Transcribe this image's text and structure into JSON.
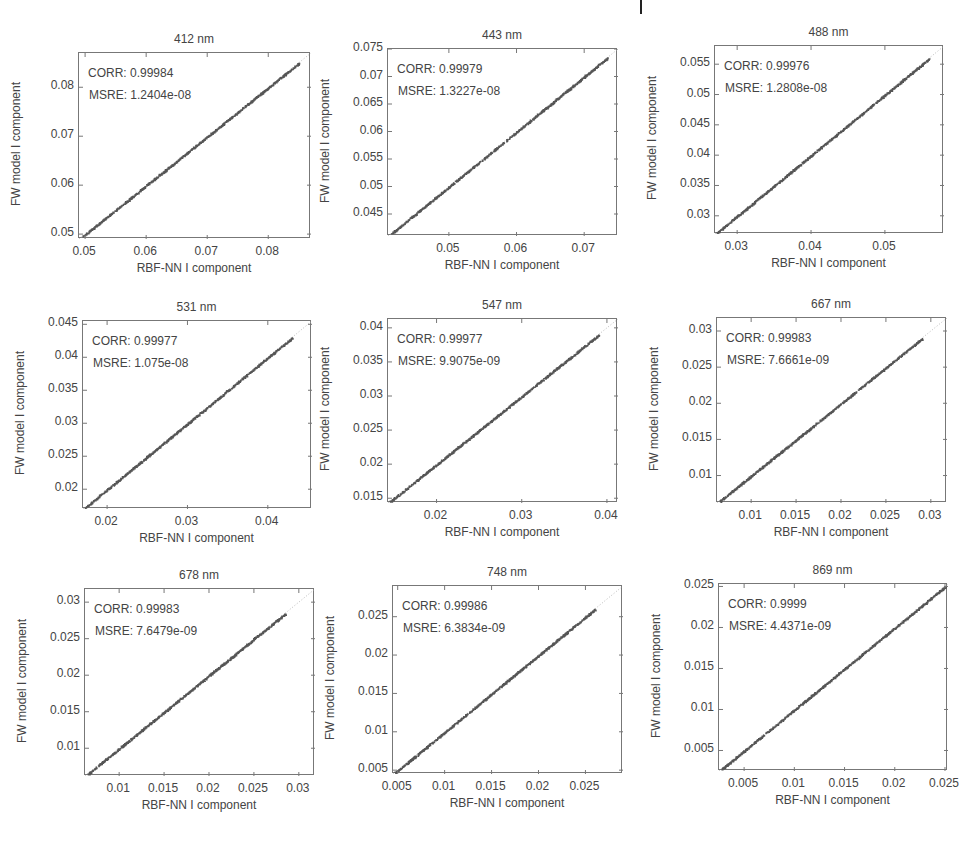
{
  "figure": {
    "xlabel": "RBF-NN I component",
    "ylabel": "FW model I component"
  },
  "chart_data": [
    {
      "type": "scatter",
      "title": "412 nm",
      "xlabel": "RBF-NN I component",
      "ylabel": "FW model I component",
      "corr": "CORR: 0.99984",
      "msre": "MSRE: 1.2404e-08",
      "xlim": [
        0.049,
        0.087
      ],
      "ylim": [
        0.049,
        0.087
      ],
      "xticks": [
        0.05,
        0.06,
        0.07,
        0.08
      ],
      "xtick_labels": [
        "0.05",
        "0.06",
        "0.07",
        "0.08"
      ],
      "yticks": [
        0.05,
        0.06,
        0.07,
        0.08
      ],
      "ytick_labels": [
        "0.05",
        "0.06",
        "0.07",
        "0.08"
      ],
      "data_range": [
        0.0495,
        0.085
      ],
      "trend": "y≈x"
    },
    {
      "type": "scatter",
      "title": "443 nm",
      "xlabel": "RBF-NN I component",
      "ylabel": "FW model I component",
      "corr": "CORR: 0.99979",
      "msre": "MSRE: 1.3227e-08",
      "xlim": [
        0.041,
        0.075
      ],
      "ylim": [
        0.041,
        0.075
      ],
      "xticks": [
        0.05,
        0.06,
        0.07
      ],
      "xtick_labels": [
        "0.05",
        "0.06",
        "0.07"
      ],
      "yticks": [
        0.045,
        0.05,
        0.055,
        0.06,
        0.065,
        0.07,
        0.075
      ],
      "ytick_labels": [
        "0.045",
        "0.05",
        "0.055",
        "0.06",
        "0.065",
        "0.07",
        "0.075"
      ],
      "data_range": [
        0.0415,
        0.0735
      ],
      "trend": "y≈x"
    },
    {
      "type": "scatter",
      "title": "488 nm",
      "xlabel": "RBF-NN I component",
      "ylabel": "FW model I component",
      "corr": "CORR: 0.99976",
      "msre": "MSRE: 1.2808e-08",
      "xlim": [
        0.027,
        0.058
      ],
      "ylim": [
        0.027,
        0.058
      ],
      "xticks": [
        0.03,
        0.04,
        0.05
      ],
      "xtick_labels": [
        "0.03",
        "0.04",
        "0.05"
      ],
      "yticks": [
        0.03,
        0.035,
        0.04,
        0.045,
        0.05,
        0.055
      ],
      "ytick_labels": [
        "0.03",
        "0.035",
        "0.04",
        "0.045",
        "0.05",
        "0.055"
      ],
      "data_range": [
        0.0272,
        0.056
      ],
      "trend": "y≈x"
    },
    {
      "type": "scatter",
      "title": "531 nm",
      "xlabel": "RBF-NN I component",
      "ylabel": "FW model I component",
      "corr": "CORR: 0.99977",
      "msre": "MSRE: 1.075e-08",
      "xlim": [
        0.017,
        0.0455
      ],
      "ylim": [
        0.017,
        0.0455
      ],
      "xticks": [
        0.02,
        0.03,
        0.04
      ],
      "xtick_labels": [
        "0.02",
        "0.03",
        "0.04"
      ],
      "yticks": [
        0.02,
        0.025,
        0.03,
        0.035,
        0.04,
        0.045
      ],
      "ytick_labels": [
        "0.02",
        "0.025",
        "0.03",
        "0.035",
        "0.04",
        "0.045"
      ],
      "data_range": [
        0.0172,
        0.043
      ],
      "trend": "y≈x"
    },
    {
      "type": "scatter",
      "title": "547 nm",
      "xlabel": "RBF-NN I component",
      "ylabel": "FW model I component",
      "corr": "CORR: 0.99977",
      "msre": "MSRE: 9.9075e-09",
      "xlim": [
        0.0143,
        0.0413
      ],
      "ylim": [
        0.0143,
        0.0413
      ],
      "xticks": [
        0.02,
        0.03,
        0.04
      ],
      "xtick_labels": [
        "0.02",
        "0.03",
        "0.04"
      ],
      "yticks": [
        0.015,
        0.02,
        0.025,
        0.03,
        0.035,
        0.04
      ],
      "ytick_labels": [
        "0.015",
        "0.02",
        "0.025",
        "0.03",
        "0.035",
        "0.04"
      ],
      "data_range": [
        0.0145,
        0.039
      ],
      "trend": "y≈x"
    },
    {
      "type": "scatter",
      "title": "667 nm",
      "xlabel": "RBF-NN I component",
      "ylabel": "FW model I component",
      "corr": "CORR: 0.99983",
      "msre": "MSRE: 7.6661e-09",
      "xlim": [
        0.0062,
        0.0318
      ],
      "ylim": [
        0.0062,
        0.0318
      ],
      "xticks": [
        0.01,
        0.015,
        0.02,
        0.025,
        0.03
      ],
      "xtick_labels": [
        "0.01",
        "0.015",
        "0.02",
        "0.025",
        "0.03"
      ],
      "yticks": [
        0.01,
        0.015,
        0.02,
        0.025,
        0.03
      ],
      "ytick_labels": [
        "0.01",
        "0.015",
        "0.02",
        "0.025",
        "0.03"
      ],
      "data_range": [
        0.0065,
        0.029
      ],
      "trend": "y≈x"
    },
    {
      "type": "scatter",
      "title": "678 nm",
      "xlabel": "RBF-NN I component",
      "ylabel": "FW model I component",
      "corr": "CORR: 0.99983",
      "msre": "MSRE: 7.6479e-09",
      "xlim": [
        0.0062,
        0.0318
      ],
      "ylim": [
        0.0062,
        0.0318
      ],
      "xticks": [
        0.01,
        0.015,
        0.02,
        0.025,
        0.03
      ],
      "xtick_labels": [
        "0.01",
        "0.015",
        "0.02",
        "0.025",
        "0.03"
      ],
      "yticks": [
        0.01,
        0.015,
        0.02,
        0.025,
        0.03
      ],
      "ytick_labels": [
        "0.01",
        "0.015",
        "0.02",
        "0.025",
        "0.03"
      ],
      "data_range": [
        0.0065,
        0.0285
      ],
      "trend": "y≈x"
    },
    {
      "type": "scatter",
      "title": "748 nm",
      "xlabel": "RBF-NN I component",
      "ylabel": "FW model I component",
      "corr": "CORR: 0.99986",
      "msre": "MSRE: 6.3834e-09",
      "xlim": [
        0.0045,
        0.029
      ],
      "ylim": [
        0.0045,
        0.029
      ],
      "xticks": [
        0.005,
        0.01,
        0.015,
        0.02,
        0.025
      ],
      "xtick_labels": [
        "0.005",
        "0.01",
        "0.015",
        "0.02",
        "0.025"
      ],
      "yticks": [
        0.005,
        0.01,
        0.015,
        0.02,
        0.025
      ],
      "ytick_labels": [
        "0.005",
        "0.01",
        "0.015",
        "0.02",
        "0.025"
      ],
      "data_range": [
        0.0047,
        0.026
      ],
      "trend": "y≈x"
    },
    {
      "type": "scatter",
      "title": "869 nm",
      "xlabel": "RBF-NN I component",
      "ylabel": "FW model I component",
      "corr": "CORR: 0.9999",
      "msre": "MSRE: 4.4371e-09",
      "xlim": [
        0.0025,
        0.0253
      ],
      "ylim": [
        0.0025,
        0.0253
      ],
      "xticks": [
        0.005,
        0.01,
        0.015,
        0.02,
        0.025
      ],
      "xtick_labels": [
        "0.005",
        "0.01",
        "0.015",
        "0.02",
        "0.025"
      ],
      "yticks": [
        0.005,
        0.01,
        0.015,
        0.02,
        0.025
      ],
      "ytick_labels": [
        "0.005",
        "0.01",
        "0.015",
        "0.02",
        "0.025"
      ],
      "data_range": [
        0.0027,
        0.025
      ],
      "trend": "y≈x"
    }
  ],
  "colors": {
    "points": "#555555",
    "axis": "#777777",
    "text": "#444444"
  }
}
